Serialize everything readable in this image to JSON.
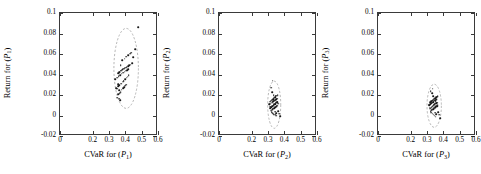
{
  "figure": {
    "type": "scatter-matrix",
    "panel_count": 3,
    "marker_color": "#1a1a1a",
    "ellipse_color": "#9a9a9a",
    "axis_color": "#3a3a3a"
  },
  "chart_data": [
    {
      "type": "scatter",
      "title": "",
      "xlabel": "CVaR for (P1)",
      "ylabel": "Return for (P1)",
      "xlim": [
        0,
        0.6
      ],
      "ylim": [
        -0.02,
        0.1
      ],
      "xticks": [
        0,
        0.2,
        0.3,
        0.4,
        0.5,
        0.6
      ],
      "xticklabels": [
        "0",
        "0.2",
        "0.3",
        "0.4",
        "0.5",
        "0.6"
      ],
      "yticks": [
        -0.02,
        0,
        0.02,
        0.04,
        0.06,
        0.08,
        0.1
      ],
      "yticklabels": [
        "-0.02",
        "0",
        "0.02",
        "0.04",
        "0.06",
        "0.08",
        "0.1"
      ],
      "grid": false,
      "legend": "none",
      "annotation": "dashed confidence ellipse",
      "ellipse": {
        "cx": 0.405,
        "cy": 0.046,
        "rx": 0.075,
        "ry": 0.039,
        "rotation_deg": 0,
        "style": "dashed"
      },
      "x": [
        0.352,
        0.362,
        0.368,
        0.357,
        0.371,
        0.379,
        0.386,
        0.392,
        0.398,
        0.404,
        0.345,
        0.355,
        0.364,
        0.374,
        0.383,
        0.391,
        0.399,
        0.408,
        0.414,
        0.421,
        0.339,
        0.349,
        0.359,
        0.369,
        0.378,
        0.388,
        0.396,
        0.405,
        0.412,
        0.419,
        0.366,
        0.376,
        0.384,
        0.393,
        0.401,
        0.409,
        0.417,
        0.425,
        0.433,
        0.441,
        0.355,
        0.363,
        0.372,
        0.381,
        0.389,
        0.447,
        0.462,
        0.478,
        0.352,
        0.361,
        0.381,
        0.396,
        0.407,
        0.418,
        0.428,
        0.437,
        0.371,
        0.358,
        0.366,
        0.389
      ],
      "y": [
        0.0175,
        0.0162,
        0.0148,
        0.0205,
        0.0228,
        0.0252,
        0.0268,
        0.0278,
        0.0291,
        0.0302,
        0.0268,
        0.0284,
        0.0296,
        0.0312,
        0.0328,
        0.0341,
        0.0356,
        0.0368,
        0.0379,
        0.0391,
        0.0352,
        0.0368,
        0.0381,
        0.0395,
        0.0408,
        0.0419,
        0.0428,
        0.0437,
        0.0444,
        0.0452,
        0.0424,
        0.0438,
        0.0449,
        0.0458,
        0.0466,
        0.0473,
        0.0481,
        0.0489,
        0.0497,
        0.0508,
        0.0412,
        0.0425,
        0.0436,
        0.0447,
        0.0457,
        0.0571,
        0.0648,
        0.0861,
        0.0262,
        0.0246,
        0.0537,
        0.0556,
        0.0572,
        0.0588,
        0.0601,
        0.0612,
        0.0488,
        0.0304,
        0.0218,
        0.0332
      ]
    },
    {
      "type": "scatter",
      "title": "",
      "xlabel": "CVaR for (P2)",
      "ylabel": "Return for (P2)",
      "xlim": [
        0,
        0.6
      ],
      "ylim": [
        -0.02,
        0.1
      ],
      "xticks": [
        0,
        0.2,
        0.3,
        0.4,
        0.5,
        0.6
      ],
      "xticklabels": [
        "0",
        "0.2",
        "0.3",
        "0.4",
        "0.5",
        "0.6"
      ],
      "yticks": [
        -0.02,
        0,
        0.02,
        0.04,
        0.06,
        0.08,
        0.1
      ],
      "yticklabels": [
        "-0.02",
        "0",
        "0.02",
        "0.04",
        "0.06",
        "0.08",
        "0.1"
      ],
      "grid": false,
      "legend": "none",
      "annotation": "dashed confidence ellipse",
      "ellipse": {
        "cx": 0.338,
        "cy": 0.0105,
        "rx": 0.04,
        "ry": 0.023,
        "rotation_deg": 0,
        "style": "dashed"
      },
      "x": [
        0.318,
        0.324,
        0.329,
        0.333,
        0.337,
        0.341,
        0.345,
        0.349,
        0.353,
        0.357,
        0.314,
        0.32,
        0.326,
        0.331,
        0.335,
        0.339,
        0.343,
        0.347,
        0.351,
        0.356,
        0.311,
        0.317,
        0.322,
        0.328,
        0.333,
        0.338,
        0.342,
        0.346,
        0.35,
        0.355,
        0.315,
        0.321,
        0.327,
        0.332,
        0.336,
        0.34,
        0.344,
        0.348,
        0.352,
        0.359,
        0.323,
        0.33,
        0.336,
        0.343,
        0.35,
        0.362,
        0.368,
        0.374,
        0.308,
        0.313,
        0.326,
        0.334,
        0.341,
        0.348,
        0.355,
        0.361,
        0.329,
        0.318,
        0.344,
        0.352
      ],
      "y": [
        0.0048,
        0.0056,
        0.0062,
        0.0068,
        0.0073,
        0.0078,
        0.0082,
        0.0086,
        0.0091,
        0.0095,
        0.0072,
        0.0081,
        0.0089,
        0.0096,
        0.0102,
        0.0108,
        0.0113,
        0.0118,
        0.0123,
        0.0128,
        0.0108,
        0.0116,
        0.0124,
        0.0131,
        0.0138,
        0.0144,
        0.0149,
        0.0154,
        0.0159,
        0.0164,
        0.0136,
        0.0145,
        0.0153,
        0.0161,
        0.0168,
        0.0174,
        0.018,
        0.0186,
        0.0192,
        0.0198,
        0.0032,
        0.0022,
        0.0014,
        0.0006,
        -0.0002,
        0.0041,
        0.0018,
        -0.0009,
        0.0112,
        0.0086,
        0.0226,
        0.0198,
        0.0174,
        0.0152,
        0.0131,
        0.0114,
        0.0341,
        0.0272,
        0.0038,
        0.0021
      ]
    },
    {
      "type": "scatter",
      "title": "",
      "xlabel": "CVaR for (P3)",
      "ylabel": "Return for (P3)",
      "xlim": [
        0,
        0.6
      ],
      "ylim": [
        -0.02,
        0.1
      ],
      "xticks": [
        0,
        0.2,
        0.3,
        0.4,
        0.5,
        0.6
      ],
      "xticklabels": [
        "0",
        "0.2",
        "0.3",
        "0.4",
        "0.5",
        "0.6"
      ],
      "yticks": [
        -0.02,
        0,
        0.02,
        0.04,
        0.06,
        0.08,
        0.1
      ],
      "yticklabels": [
        "-0.02",
        "0",
        "0.02",
        "0.04",
        "0.06",
        "0.08",
        "0.1"
      ],
      "grid": false,
      "legend": "none",
      "annotation": "dashed confidence ellipse",
      "ellipse": {
        "cx": 0.344,
        "cy": 0.0095,
        "rx": 0.044,
        "ry": 0.021,
        "rotation_deg": 0,
        "style": "dashed"
      },
      "x": [
        0.322,
        0.328,
        0.333,
        0.338,
        0.342,
        0.346,
        0.35,
        0.354,
        0.358,
        0.362,
        0.318,
        0.324,
        0.33,
        0.335,
        0.34,
        0.344,
        0.348,
        0.352,
        0.357,
        0.361,
        0.314,
        0.32,
        0.326,
        0.332,
        0.337,
        0.342,
        0.347,
        0.351,
        0.356,
        0.36,
        0.319,
        0.325,
        0.331,
        0.336,
        0.341,
        0.346,
        0.351,
        0.356,
        0.361,
        0.366,
        0.327,
        0.334,
        0.34,
        0.347,
        0.354,
        0.368,
        0.374,
        0.38,
        0.311,
        0.316,
        0.331,
        0.339,
        0.346,
        0.353,
        0.36,
        0.366,
        0.334,
        0.323,
        0.349,
        0.357
      ],
      "y": [
        0.0042,
        0.0051,
        0.0058,
        0.0064,
        0.0069,
        0.0074,
        0.0079,
        0.0083,
        0.0088,
        0.0093,
        0.0068,
        0.0077,
        0.0085,
        0.0092,
        0.0098,
        0.0104,
        0.0109,
        0.0114,
        0.0119,
        0.0124,
        0.0102,
        0.011,
        0.0118,
        0.0125,
        0.0132,
        0.0138,
        0.0143,
        0.0148,
        0.0153,
        0.0158,
        0.0128,
        0.0137,
        0.0145,
        0.0152,
        0.0159,
        0.0165,
        0.0171,
        0.0177,
        0.0183,
        0.0189,
        0.0026,
        0.0016,
        0.0008,
        -0.0001,
        -0.0012,
        0.0032,
        0.0008,
        -0.0024,
        0.0106,
        0.0078,
        0.0218,
        0.0188,
        0.0164,
        0.0142,
        0.0121,
        0.0102,
        0.0262,
        0.0238,
        0.0028,
        0.0012
      ]
    }
  ]
}
